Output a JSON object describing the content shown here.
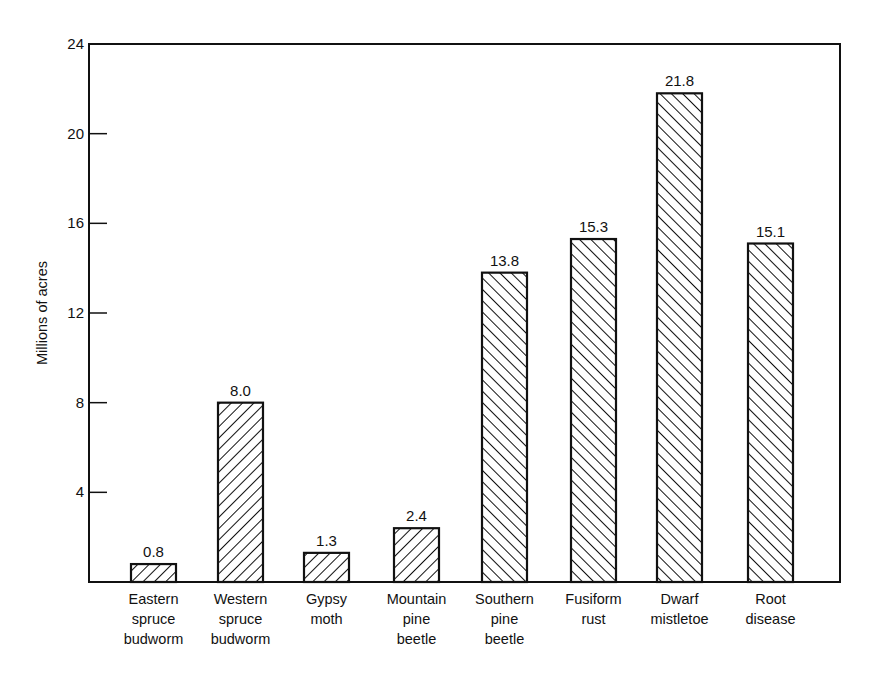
{
  "chart_data": {
    "type": "bar",
    "title": "",
    "xlabel": "",
    "ylabel": "Millions of acres",
    "ylim": [
      0,
      24
    ],
    "yticks": [
      4,
      8,
      12,
      16,
      20,
      24
    ],
    "grid": false,
    "legend": null,
    "categories": [
      "Eastern spruce budworm",
      "Western spruce budworm",
      "Gypsy moth",
      "Mountain pine beetle",
      "Southern pine beetle",
      "Fusiform rust",
      "Dwarf mistletoe",
      "Root disease"
    ],
    "category_lines": [
      [
        "Eastern",
        "spruce",
        "budworm"
      ],
      [
        "Western",
        "spruce",
        "budworm"
      ],
      [
        "Gypsy",
        "moth"
      ],
      [
        "Mountain",
        "pine",
        "beetle"
      ],
      [
        "Southern",
        "pine",
        "beetle"
      ],
      [
        "Fusiform",
        "rust"
      ],
      [
        "Dwarf",
        "mistletoe"
      ],
      [
        "Root",
        "disease"
      ]
    ],
    "values": [
      0.8,
      8.0,
      1.3,
      2.4,
      13.8,
      15.3,
      21.8,
      15.1
    ],
    "value_labels": [
      "0.8",
      "8.0",
      "1.3",
      "2.4",
      "13.8",
      "15.3",
      "21.8",
      "15.1"
    ],
    "hatch": [
      "back",
      "back",
      "back",
      "back",
      "forward",
      "forward",
      "forward",
      "forward"
    ],
    "colors": {
      "ink": "#111111",
      "background": "#ffffff"
    }
  }
}
